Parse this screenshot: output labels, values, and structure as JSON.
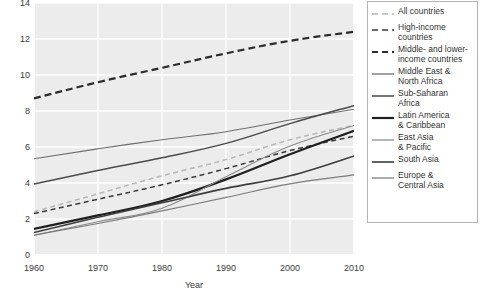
{
  "chart_data": {
    "type": "line",
    "title": "",
    "xlabel": "Year",
    "ylabel": "",
    "xlim": [
      1960,
      2010
    ],
    "ylim": [
      0,
      14
    ],
    "grid": true,
    "legend_position": "right",
    "x": [
      1960,
      1970,
      1980,
      1990,
      2000,
      2010
    ],
    "xticks": [
      "1960",
      "1970",
      "1980",
      "1990",
      "2000",
      "2010"
    ],
    "yticks": [
      "0",
      "2",
      "4",
      "6",
      "8",
      "10",
      "12",
      "14"
    ],
    "series": [
      {
        "name": "All countries",
        "style": "dashed",
        "color": "#b9b9b9",
        "width": 1.6,
        "values": [
          2.4,
          3.4,
          4.4,
          5.3,
          6.4,
          7.2
        ]
      },
      {
        "name": "High-income countries",
        "style": "dashed",
        "color": "#3a3a3a",
        "width": 1.5,
        "values": [
          2.3,
          3.1,
          3.9,
          4.8,
          5.8,
          6.6
        ]
      },
      {
        "name": "Middle- and lower-income countries",
        "style": "dashed",
        "color": "#2b2b2b",
        "width": 2.2,
        "values": [
          8.7,
          9.6,
          10.4,
          11.2,
          11.9,
          12.4
        ]
      },
      {
        "name": "Middle East & North Africa",
        "style": "solid",
        "color": "#6e6e6e",
        "width": 1.1,
        "values": [
          5.35,
          5.9,
          6.4,
          6.85,
          7.5,
          8.1
        ]
      },
      {
        "name": "Sub-Saharan Africa",
        "style": "solid",
        "color": "#4a4a4a",
        "width": 1.5,
        "values": [
          3.95,
          4.7,
          5.4,
          6.2,
          7.3,
          8.3
        ]
      },
      {
        "name": "Latin America & Caribbean",
        "style": "solid",
        "color": "#1f1f1f",
        "width": 2.2,
        "values": [
          1.45,
          2.2,
          3.0,
          4.2,
          5.6,
          6.9
        ]
      },
      {
        "name": "East Asia & Pacific",
        "style": "solid",
        "color": "#8a8a8a",
        "width": 1.1,
        "values": [
          1.1,
          1.85,
          2.6,
          4.35,
          6.05,
          7.2
        ]
      },
      {
        "name": "South Asia",
        "style": "solid",
        "color": "#3d3d3d",
        "width": 1.6,
        "values": [
          1.25,
          2.1,
          2.9,
          3.7,
          4.4,
          5.5
        ]
      },
      {
        "name": "Europe & Central Asia",
        "style": "solid",
        "color": "#7c7c7c",
        "width": 1.2,
        "values": [
          1.1,
          1.75,
          2.45,
          3.2,
          3.95,
          4.45
        ]
      }
    ]
  },
  "axes": {
    "x_title": "Year",
    "yticks": [
      "14",
      "12",
      "10",
      "8",
      "6",
      "4",
      "2",
      "0"
    ],
    "xticks": [
      "1960",
      "1970",
      "1980",
      "1990",
      "2000",
      "2010"
    ]
  },
  "legend": {
    "items": [
      {
        "label": "All countries"
      },
      {
        "label": "High-income\ncountries"
      },
      {
        "label": "Middle- and lower-\nincome countries"
      },
      {
        "label": "Middle East &\nNorth Africa"
      },
      {
        "label": "Sub-Saharan\nAfrica"
      },
      {
        "label": "Latin America\n& Caribbean"
      },
      {
        "label": "East Asia\n& Pacific"
      },
      {
        "label": "South Asia"
      },
      {
        "label": "Europe &\nCentral Asia"
      }
    ]
  },
  "colors": {
    "plot_background": "#ececec",
    "grid": "#ffffff",
    "legend_border": "#b4b4b4",
    "text": "#3c3c3c"
  }
}
